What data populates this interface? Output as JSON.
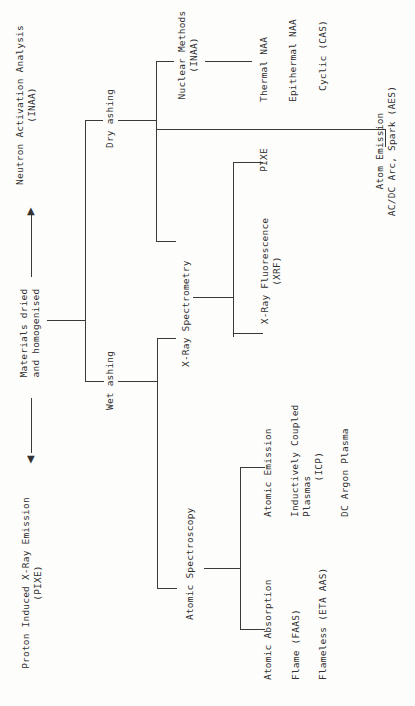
{
  "diagram": {
    "type": "tree",
    "orientation": "rotated-90-ccw",
    "root": {
      "label": "Materials dried\nand homogenised",
      "left_arrow_target": "Proton Induced X-Ray Emission\n(PIXE)",
      "right_arrow_target": "Neutron Activation Analysis\n(INAA)"
    },
    "branches": {
      "wet_ashing": "Wet ashing",
      "dry_ashing": "Dry ashing"
    },
    "methods": {
      "atomic_spectroscopy": "Atomic Spectroscopy",
      "xray_spectrometry": "X-Ray Spectrometry",
      "nuclear_methods": "Nuclear Methods\n(INAA)",
      "atom_emission": "Atom Emission\nAC/DC Arc, Spark (AES)"
    },
    "atomic_spectroscopy_children": {
      "atomic_absorption": "Atomic Absorption",
      "atomic_emission": "Atomic Emission"
    },
    "atomic_absorption_items": [
      "Flame (FAAS)",
      "Flameless (ETA AAS)"
    ],
    "atomic_emission_items": {
      "icp": "Inductively Coupled\nPlasmas\n      (ICP)",
      "dc_argon": "DC Argon Plasma"
    },
    "xray_children": {
      "xrf": "X-Ray Fluorescence\n(XRF)",
      "pixe": "PIXE"
    },
    "nuclear_items": [
      "Thermal NAA",
      "Epithermal NAA",
      "Cyclic (CAS)"
    ]
  }
}
